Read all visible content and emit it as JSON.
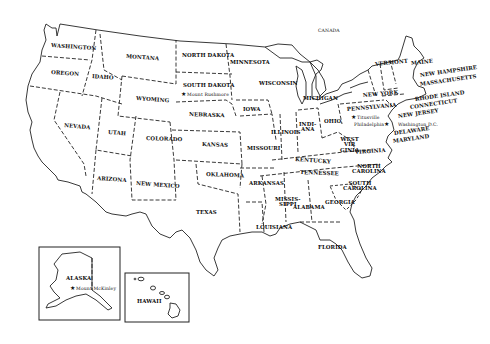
{
  "map": {
    "title": "United States",
    "neighbors": [
      {
        "id": "canada",
        "label": "CANADA",
        "x": 318,
        "y": 29
      }
    ],
    "states": [
      {
        "id": "washington",
        "label": "WASHINGTON",
        "x": 51,
        "y": 43,
        "rot": 4
      },
      {
        "id": "oregon",
        "label": "OREGON",
        "x": 51,
        "y": 70,
        "rot": 4
      },
      {
        "id": "idaho",
        "label": "IDAHO",
        "x": 92,
        "y": 74,
        "rot": 4
      },
      {
        "id": "montana",
        "label": "MONTANA",
        "x": 126,
        "y": 54,
        "rot": 4
      },
      {
        "id": "north-dakota",
        "label": "NORTH DAKOTA",
        "x": 182,
        "y": 53,
        "rot": 0
      },
      {
        "id": "minnesota",
        "label": "MINNESOTA",
        "x": 230,
        "y": 60,
        "rot": 0
      },
      {
        "id": "south-dakota",
        "label": "SOUTH DAKOTA",
        "x": 183,
        "y": 83,
        "rot": 0
      },
      {
        "id": "wyoming",
        "label": "WYOMING",
        "x": 136,
        "y": 96,
        "rot": 4
      },
      {
        "id": "nebraska",
        "label": "NEBRASKA",
        "x": 189,
        "y": 112,
        "rot": 2
      },
      {
        "id": "iowa",
        "label": "IOWA",
        "x": 243,
        "y": 107,
        "rot": 0
      },
      {
        "id": "wisconsin",
        "label": "WISCONSIN",
        "x": 259,
        "y": 81,
        "rot": 0
      },
      {
        "id": "michigan",
        "label": "MICHIGAN",
        "x": 303,
        "y": 96,
        "rot": 0
      },
      {
        "id": "nevada",
        "label": "NEVADA",
        "x": 64,
        "y": 123,
        "rot": 5
      },
      {
        "id": "utah",
        "label": "UTAH",
        "x": 108,
        "y": 130,
        "rot": 4
      },
      {
        "id": "colorado",
        "label": "COLORADO",
        "x": 146,
        "y": 136,
        "rot": 2
      },
      {
        "id": "kansas",
        "label": "KANSAS",
        "x": 202,
        "y": 142,
        "rot": 2
      },
      {
        "id": "missouri",
        "label": "MISSOURI",
        "x": 247,
        "y": 146,
        "rot": 0
      },
      {
        "id": "illinois",
        "label": "ILLINOIS",
        "x": 271,
        "y": 130,
        "rot": 0
      },
      {
        "id": "indiana",
        "label": "INDI-\nANA",
        "x": 299,
        "y": 122,
        "rot": 0
      },
      {
        "id": "ohio",
        "label": "OHIO",
        "x": 324,
        "y": 119,
        "rot": 0
      },
      {
        "id": "pennsylvania",
        "label": "PENNSYLVANIA",
        "x": 347,
        "y": 107,
        "rot": -5
      },
      {
        "id": "new-york",
        "label": "NEW YORK",
        "x": 363,
        "y": 93,
        "rot": -5
      },
      {
        "id": "vermont",
        "label": "VERMONT",
        "x": 375,
        "y": 62,
        "rot": -6
      },
      {
        "id": "maine",
        "label": "MAINE",
        "x": 411,
        "y": 61,
        "rot": -6
      },
      {
        "id": "new-hampshire",
        "label": "NEW HAMPSHIRE",
        "x": 420,
        "y": 73,
        "rot": -8
      },
      {
        "id": "massachusetts",
        "label": "MASSACHUSETTS",
        "x": 420,
        "y": 82,
        "rot": -8
      },
      {
        "id": "rhode-island",
        "label": "RHODE ISLAND",
        "x": 415,
        "y": 97,
        "rot": -8
      },
      {
        "id": "connecticut",
        "label": "CONNECTICUT",
        "x": 410,
        "y": 105,
        "rot": -8
      },
      {
        "id": "new-jersey",
        "label": "NEW JERSEY",
        "x": 398,
        "y": 114,
        "rot": -8
      },
      {
        "id": "delaware",
        "label": "DELAWARE",
        "x": 394,
        "y": 131,
        "rot": -8
      },
      {
        "id": "maryland",
        "label": "MARYLAND",
        "x": 393,
        "y": 139,
        "rot": -8
      },
      {
        "id": "west-virginia",
        "label": "WEST\nVIR\nGINIA",
        "x": 340,
        "y": 137,
        "rot": 0
      },
      {
        "id": "virginia",
        "label": "VIRGINIA",
        "x": 355,
        "y": 150,
        "rot": -4
      },
      {
        "id": "kentucky",
        "label": "KENTUCKY",
        "x": 295,
        "y": 157,
        "rot": 4
      },
      {
        "id": "tennessee",
        "label": "TENNESSEE",
        "x": 300,
        "y": 170,
        "rot": 2
      },
      {
        "id": "north-carolina",
        "label": "NORTH\nCAROLINA",
        "x": 352,
        "y": 164,
        "rot": 0
      },
      {
        "id": "south-carolina",
        "label": "SOUTH\nCAROLINA",
        "x": 343,
        "y": 181,
        "rot": 0
      },
      {
        "id": "arizona",
        "label": "ARIZONA",
        "x": 97,
        "y": 176,
        "rot": 4
      },
      {
        "id": "new-mexico",
        "label": "NEW MEXICO",
        "x": 136,
        "y": 181,
        "rot": 4
      },
      {
        "id": "oklahoma",
        "label": "OKLAHOMA",
        "x": 206,
        "y": 172,
        "rot": 2
      },
      {
        "id": "arkansas",
        "label": "ARKANSAS",
        "x": 249,
        "y": 181,
        "rot": 0
      },
      {
        "id": "texas",
        "label": "TEXAS",
        "x": 196,
        "y": 210,
        "rot": 0
      },
      {
        "id": "mississippi",
        "label": "MISSIS-\nSIPPI",
        "x": 275,
        "y": 197,
        "rot": 0
      },
      {
        "id": "alabama",
        "label": "ALABAMA",
        "x": 293,
        "y": 205,
        "rot": 0
      },
      {
        "id": "georgia",
        "label": "GEORGIA",
        "x": 325,
        "y": 200,
        "rot": 0
      },
      {
        "id": "louisiana",
        "label": "LOUISIANA",
        "x": 256,
        "y": 225,
        "rot": 0
      },
      {
        "id": "florida",
        "label": "FLORIDA",
        "x": 318,
        "y": 245,
        "rot": 0
      },
      {
        "id": "alaska",
        "label": "ALASKA",
        "x": 66,
        "y": 276,
        "rot": 0
      },
      {
        "id": "hawaii",
        "label": "HAWAII",
        "x": 137,
        "y": 299,
        "rot": 0
      }
    ],
    "landmarks": [
      {
        "id": "mount-rushmore",
        "label": "Mount Rushmore",
        "symbol": "★",
        "x": 181,
        "y": 91
      },
      {
        "id": "titusville",
        "label": "Titusville",
        "symbol": "★",
        "x": 351,
        "y": 114
      },
      {
        "id": "philadelphia",
        "label": "Philadelphia",
        "symbol": "★",
        "x": 354,
        "y": 121,
        "symbol_after": true
      },
      {
        "id": "washington-dc",
        "label": "Washington D.C.",
        "symbol": "",
        "x": 398,
        "y": 123
      },
      {
        "id": "mount-mckinley",
        "label": "Mount McKinley",
        "symbol": "★",
        "x": 70,
        "y": 285
      }
    ]
  }
}
